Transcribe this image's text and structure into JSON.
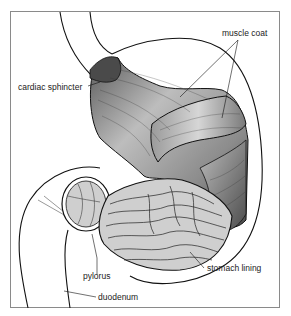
{
  "diagram": {
    "labels": {
      "muscle_coat": "muscle coat",
      "cardiac_sphincter": "cardiac sphincter",
      "pylorus": "pylorus",
      "stomach_lining": "stomach lining",
      "duodenum": "duodenum"
    },
    "colors": {
      "frame": "#8a8a8a",
      "outline": "#111111",
      "muscle_dark": "#6e6e6e",
      "muscle_light": "#c8c8c8",
      "lining_fill": "#cfcfcf",
      "background": "#ffffff"
    }
  }
}
